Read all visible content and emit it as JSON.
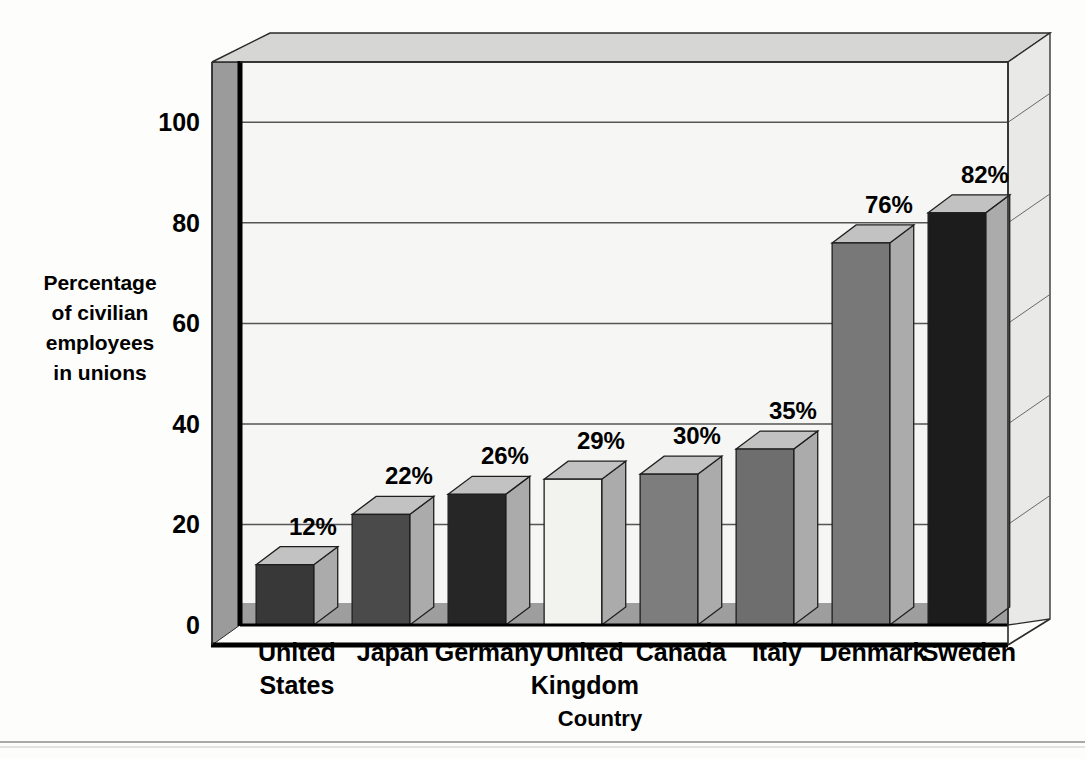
{
  "chart_data": {
    "type": "bar",
    "title": "",
    "xlabel": "Country",
    "ylabel_lines": [
      "Percentage",
      "of civilian",
      "employees",
      "in unions"
    ],
    "ylabel": "Percentage of civilian employees in unions",
    "categories": [
      "United States",
      "Japan",
      "Germany",
      "United Kingdom",
      "Canada",
      "Italy",
      "Denmark",
      "Sweden"
    ],
    "category_lines": [
      [
        "United",
        "States"
      ],
      [
        "Japan"
      ],
      [
        "Germany"
      ],
      [
        "United",
        "Kingdom"
      ],
      [
        "Canada"
      ],
      [
        "Italy"
      ],
      [
        "Denmark"
      ],
      [
        "Sweden"
      ]
    ],
    "values": [
      12,
      22,
      26,
      29,
      30,
      35,
      76,
      82
    ],
    "value_labels": [
      "12%",
      "22%",
      "26%",
      "29%",
      "30%",
      "35%",
      "76%",
      "82%"
    ],
    "ylim": [
      0,
      100
    ],
    "y_ticks": [
      0,
      20,
      40,
      60,
      80,
      100
    ],
    "y_tick_labels": [
      "0",
      "20",
      "40",
      "60",
      "80",
      "100"
    ],
    "grid": true,
    "legend": "none",
    "style": "3d-column",
    "bar_face_colors": [
      "#383838",
      "#4a4a4a",
      "#262626",
      "#f2f2ee",
      "#7d7d7d",
      "#6e6e6e",
      "#787878",
      "#1c1c1c"
    ],
    "bar_top_color": "#c2c2c2",
    "bar_side_color": "#ababab",
    "plot_bg": "#f6f6f4",
    "wall_color": "#9b9b9b",
    "floor_color": "#9b9b9b",
    "ceiling_color": "#d6d6d4",
    "gridline_color": "#555555",
    "axis_color": "#000000"
  },
  "footer": {
    "rule": ""
  }
}
